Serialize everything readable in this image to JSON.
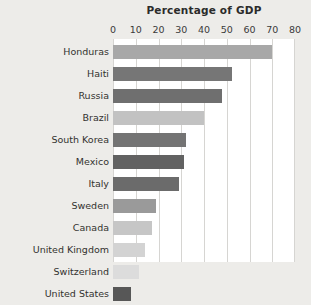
{
  "chart_data": {
    "type": "bar",
    "orientation": "horizontal",
    "title": "Percentage of GDP",
    "xlabel": "",
    "ylabel": "",
    "xlim": [
      0,
      80
    ],
    "xticks": [
      0,
      10,
      20,
      30,
      40,
      50,
      60,
      70,
      80
    ],
    "xtick_labels": [
      "0",
      "10",
      "20",
      "30",
      "40",
      "50",
      "60",
      "70",
      "80"
    ],
    "grid": "vertical",
    "legend": "none",
    "background_color": "#edece9",
    "plot_background_color": "#ffffff",
    "gridline_color": "#d6d5d2",
    "categories": [
      "Honduras",
      "Haiti",
      "Russia",
      "Brazil",
      "South Korea",
      "Mexico",
      "Italy",
      "Sweden",
      "Canada",
      "United Kingdom",
      "Switzerland",
      "United States"
    ],
    "values": [
      70,
      52.5,
      48,
      40,
      32,
      31,
      29,
      19,
      17,
      14,
      11.5,
      8
    ],
    "bar_colors": [
      "#a8a8a8",
      "#767676",
      "#6f6f6f",
      "#c2c2c2",
      "#747474",
      "#626262",
      "#6b6b6b",
      "#9a9a9a",
      "#c6c6c6",
      "#d3d3d3",
      "#dcdcdc",
      "#575757"
    ]
  }
}
